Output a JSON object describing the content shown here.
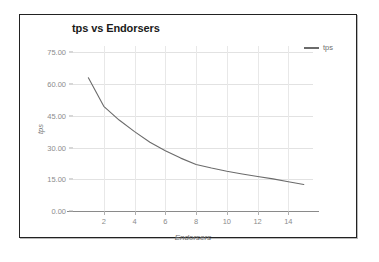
{
  "chart_data": {
    "type": "line",
    "title": "tps vs Endorsers",
    "xlabel": "Endorsers",
    "ylabel": "tps",
    "xlim": [
      0,
      15.6
    ],
    "ylim": [
      0,
      78
    ],
    "grid": true,
    "legend_position": "top-right",
    "line_color": "#6b6b6b",
    "grid_color": "#e2e2e2",
    "axis_color": "#8a8a8a",
    "tick_label_color": "#8c8c8c",
    "y_ticks": [
      "0.00",
      "15.00",
      "30.00",
      "45.00",
      "60.00",
      "75.00"
    ],
    "y_tick_values": [
      0,
      15,
      30,
      45,
      60,
      75
    ],
    "x_ticks": [
      "2",
      "4",
      "6",
      "8",
      "10",
      "12",
      "14"
    ],
    "x_tick_values": [
      2,
      4,
      6,
      8,
      10,
      12,
      14
    ],
    "series": [
      {
        "name": "tps",
        "x": [
          1,
          2,
          3,
          4,
          5,
          6,
          7,
          8,
          9,
          10,
          11,
          12,
          13,
          14,
          15
        ],
        "values": [
          63.0,
          49.5,
          43.0,
          37.5,
          32.5,
          28.5,
          25.0,
          22.0,
          20.3,
          18.8,
          17.5,
          16.3,
          15.2,
          13.8,
          12.5
        ]
      }
    ]
  },
  "legend": {
    "entries": [
      {
        "label": "tps"
      }
    ]
  }
}
